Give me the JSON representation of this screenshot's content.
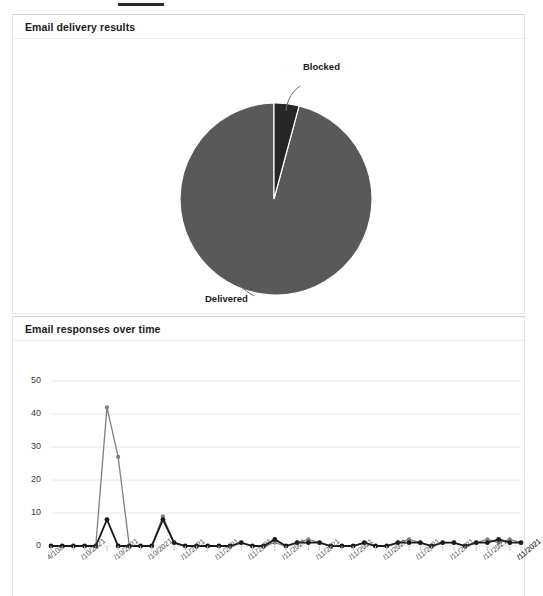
{
  "page": {
    "top_rule": "divider"
  },
  "cards": [
    {
      "id": "delivery",
      "title": "Email delivery results"
    },
    {
      "id": "responses",
      "title": "Email responses over time"
    }
  ],
  "colors": {
    "delivered": "#595959",
    "blocked": "#262626",
    "series_light": "#7f7f7f",
    "series_dark": "#1a1a1a",
    "grid": "#e8e8e8",
    "card_border": "#e6e6e6",
    "text": "#1b1b1b"
  },
  "chart_data": [
    {
      "type": "pie",
      "title": "Email delivery results",
      "labels": [
        "Delivered",
        "Blocked"
      ],
      "values": [
        95.8,
        4.2
      ],
      "colors": [
        "#595959",
        "#262626"
      ],
      "annotations": [
        "Delivered",
        "Blocked"
      ],
      "legend": "none",
      "start_angle_deg": 0
    },
    {
      "type": "line",
      "title": "Email responses over time",
      "xlabel": "",
      "ylabel": "",
      "ylim": [
        0,
        50
      ],
      "yticks": [
        0,
        10,
        20,
        30,
        40,
        50
      ],
      "grid": true,
      "legend": "none",
      "categories": [
        "4/10/...",
        "5/10/2021",
        "6/10/2021",
        "7/10/2021",
        "8/10/2021",
        "9/10/2021",
        "10/10/2021",
        "11/10/2021",
        "12/10/2021",
        "13/10/2021",
        "14/10/2021",
        "15/10/2021",
        "16/10/2021",
        "17/10/2021",
        "18/10/2021",
        "19/10/2021",
        "20/10/2021",
        "21/10/2021",
        "22/10/2021",
        "23/10/2021",
        "24/10/2021",
        "25/10/2021",
        "26/10/2021",
        "27/10/2021",
        "28/10/2021",
        "29/10/2021",
        "30/10/2021",
        "31/10/2021",
        "1/11/2021",
        "2/11/2021",
        "3/11/2021",
        "4/11/2021",
        "5/11/2021",
        "6/11/2021",
        "7/11/2021",
        "8/11/2021",
        "9/11/2021",
        "10/11/2021",
        "11/11/2021",
        "12/11/2021",
        "13/11/2021",
        "14/11/2021",
        "15/11/2021"
      ],
      "xtick_labels": [
        "4/10/...",
        "/10/2021",
        "/10/2021",
        "/10/2021",
        "/11/2021",
        "/11/2021",
        "/11/2021",
        "/11/2021",
        "/11/2021",
        "/11/2021",
        "/11/2021",
        "/11/2021",
        "/11/2021",
        "/11/2021",
        "/11/2021",
        "/11/2021"
      ],
      "series": [
        {
          "name": "Series A",
          "color": "#7f7f7f",
          "values": [
            0,
            0,
            0,
            0,
            0,
            42,
            27,
            0,
            0,
            0,
            9,
            1,
            0,
            0,
            0,
            0,
            0,
            1,
            0,
            0,
            1,
            0,
            1,
            2,
            1,
            0,
            0,
            0,
            1,
            0,
            0,
            1,
            2,
            1,
            0,
            1,
            1,
            0,
            1,
            2,
            1,
            2,
            1
          ]
        },
        {
          "name": "Series B",
          "color": "#1a1a1a",
          "values": [
            0,
            0,
            0,
            0,
            0,
            8,
            0,
            0,
            0,
            0,
            8,
            1,
            0,
            0,
            0,
            0,
            0,
            1,
            0,
            0,
            2,
            0,
            1,
            1,
            1,
            0,
            0,
            0,
            1,
            0,
            0,
            1,
            1,
            1,
            0,
            1,
            1,
            0,
            1,
            1,
            2,
            1,
            1
          ]
        }
      ]
    }
  ]
}
